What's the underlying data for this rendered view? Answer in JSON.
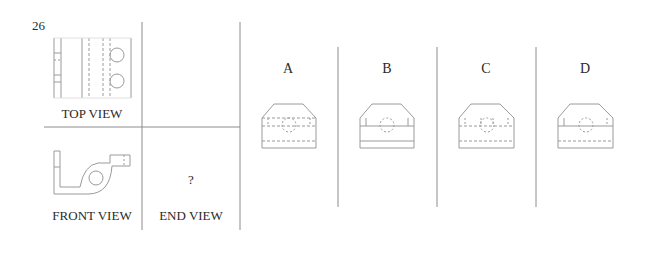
{
  "question": {
    "number": "26",
    "missing_view_marker": "?"
  },
  "views": {
    "top_label": "TOP VIEW",
    "front_label": "FRONT VIEW",
    "end_label": "END VIEW"
  },
  "options": [
    {
      "letter": "A"
    },
    {
      "letter": "B"
    },
    {
      "letter": "C"
    },
    {
      "letter": "D"
    }
  ],
  "colors": {
    "line": "#9a9a9a",
    "divider": "#8c8c8c",
    "text": "#2a2a2a"
  }
}
